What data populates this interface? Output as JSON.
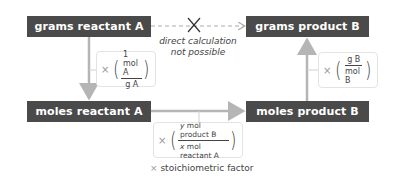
{
  "nodes": {
    "grams_reactant": "grams reactant A",
    "grams_product": "grams product B",
    "moles_reactant": "moles reactant A",
    "moles_product": "moles product B"
  },
  "direct": {
    "line1": "direct calculation",
    "line2": "not possible"
  },
  "factors": {
    "times_symbol": "×",
    "molar_mass_A": {
      "numerator": "1 mol A",
      "denominator": "g A"
    },
    "molar_mass_B": {
      "numerator": "g B",
      "denominator": "mol B"
    },
    "stoich": {
      "numerator_var": "y",
      "numerator_rest": " mol product B",
      "denominator_var": "x",
      "denominator_rest": " mol reactant A"
    }
  },
  "caption": {
    "times_symbol": "×",
    "text": " stoichiometric factor"
  },
  "colors": {
    "node_bg": "#4a4a4a",
    "arrow": "#b5b5b5",
    "dashed_arrow": "#aaaaaa",
    "x_mark": "#333333"
  }
}
